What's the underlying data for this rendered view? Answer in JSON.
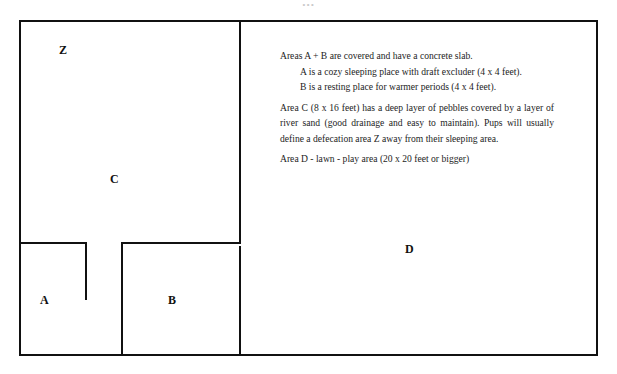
{
  "figure": {
    "title_remnant": "...",
    "type": "floor-plan-diagram",
    "line_color": "#111111",
    "background_color": "#ffffff"
  },
  "plan": {
    "areas": [
      {
        "key": "Z",
        "label": "Z",
        "role": "defecation area"
      },
      {
        "key": "C",
        "label": "C",
        "role": "pebble and river sand run"
      },
      {
        "key": "A",
        "label": "A",
        "role": "cozy sleeping place"
      },
      {
        "key": "B",
        "label": "B",
        "role": "resting place for warmer periods"
      },
      {
        "key": "D",
        "label": "D",
        "role": "lawn - play area"
      }
    ]
  },
  "legend": {
    "lines": [
      {
        "text": "Areas A + B are covered and have a concrete slab.",
        "style": "flush"
      },
      {
        "text": "A is a cozy sleeping place with draft excluder (4 x 4 feet).",
        "style": "indented"
      },
      {
        "text": "B is a resting place for warmer periods (4 x 4 feet).",
        "style": "indented"
      },
      {
        "text": "Area C (8 x 16 feet) has a deep layer of pebbles covered by a layer of river sand (good drainage and easy to maintain). Pups will usually define a defecation area Z away from their sleeping area.",
        "style": "justified"
      },
      {
        "text": "Area D - lawn - play area (20 x 20 feet or bigger)",
        "style": "flush"
      }
    ]
  }
}
